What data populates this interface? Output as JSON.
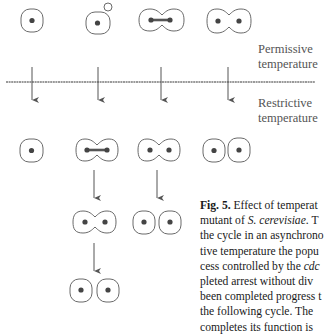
{
  "labels": {
    "permissive": [
      "Permissive",
      "temperature"
    ],
    "restrictive": [
      "Restrictive",
      "temperature"
    ]
  },
  "caption": {
    "fig_label": "Fig. 5.",
    "lines": [
      {
        "prefix": "",
        "text": " Effect of temperat"
      },
      {
        "prefix": "mutant of ",
        "italic": "S. cerevisiae",
        "suffix": ". T"
      },
      {
        "text": "the cycle in an asynchrono"
      },
      {
        "text": "tive temperature the popu"
      },
      {
        "prefix": "cess controlled by the ",
        "italic": "cdc",
        "suffix": ""
      },
      {
        "text": "pleted arrest without div"
      },
      {
        "text": "been completed progress t"
      },
      {
        "text": "the following cycle. The"
      },
      {
        "text": "completes its function is"
      }
    ]
  },
  "colors": {
    "outline": "#6a6a6a",
    "nucleus": "#444444",
    "line": "#9a9a9a",
    "arrow": "#555555"
  },
  "diagram": {
    "stages": [
      "unbudded cell",
      "budding cell",
      "nuclear division (dumbbell)",
      "binucleate cell",
      "separated daughter cells"
    ]
  }
}
